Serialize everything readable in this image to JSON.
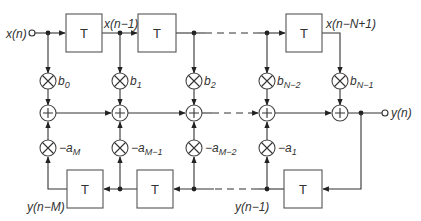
{
  "diagram": {
    "type": "IIR direct form I block diagram",
    "input_label": "x(n)",
    "output_label": "y(n)",
    "delay_label": "T",
    "top_delay_labels": [
      "x(n−1)",
      "x(n−N+1)"
    ],
    "bottom_delay_labels": [
      "y(n−M)",
      "y(n−1)"
    ],
    "feedforward_coefficients": [
      {
        "base": "b",
        "sub": "0"
      },
      {
        "base": "b",
        "sub": "1"
      },
      {
        "base": "b",
        "sub": "2"
      },
      {
        "base": "b",
        "sub": "N−2"
      },
      {
        "base": "b",
        "sub": "N−1"
      }
    ],
    "feedback_coefficients": [
      {
        "base": "−a",
        "sub": "M"
      },
      {
        "base": "−a",
        "sub": "M−1"
      },
      {
        "base": "−a",
        "sub": "M−2"
      },
      {
        "base": "−a",
        "sub": "1"
      }
    ],
    "multiplier_symbol": "×",
    "adder_symbol": "+"
  }
}
